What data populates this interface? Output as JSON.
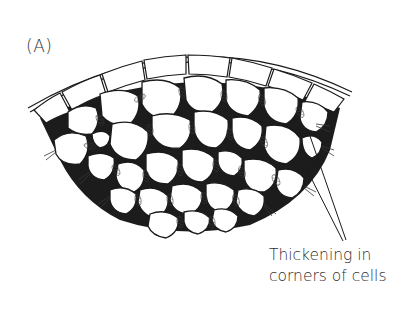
{
  "figure": {
    "panel_label": "(A)",
    "layers": {
      "epidermis_cells": 9,
      "collenchyma_cells_approx": 34
    },
    "callout": {
      "lines": [
        "Thickening in",
        "corners of cells"
      ],
      "leader_line_count": 2
    },
    "colors": {
      "background": "#ffffff",
      "ink": "#1a1a1a",
      "wall_shading": "#555555",
      "text": "#2f2f2f"
    }
  }
}
